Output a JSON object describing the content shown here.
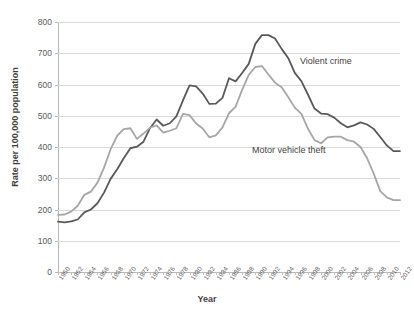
{
  "chart_data": {
    "type": "line",
    "title": "",
    "xlabel": "Year",
    "ylabel": "Rate per 100,000 population",
    "xlim": [
      1960,
      2012
    ],
    "ylim": [
      0,
      800
    ],
    "grid": true,
    "legend": "inline-annotations",
    "y_ticks": [
      0,
      100,
      200,
      300,
      400,
      500,
      600,
      700,
      800
    ],
    "x_tick_labels": [
      "1960",
      "1962",
      "1964",
      "1966",
      "1968",
      "1970",
      "1972",
      "1974",
      "1976",
      "1978",
      "1980",
      "1982",
      "1984",
      "1986",
      "1988",
      "1990",
      "1992",
      "1994",
      "1996",
      "1998",
      "2000",
      "2002",
      "2004",
      "2006",
      "2008",
      "2010",
      "2012"
    ],
    "x": [
      1960,
      1961,
      1962,
      1963,
      1964,
      1965,
      1966,
      1967,
      1968,
      1969,
      1970,
      1971,
      1972,
      1973,
      1974,
      1975,
      1976,
      1977,
      1978,
      1979,
      1980,
      1981,
      1982,
      1983,
      1984,
      1985,
      1986,
      1987,
      1988,
      1989,
      1990,
      1991,
      1992,
      1993,
      1994,
      1995,
      1996,
      1997,
      1998,
      1999,
      2000,
      2001,
      2002,
      2003,
      2004,
      2005,
      2006,
      2007,
      2008,
      2009,
      2010,
      2011,
      2012
    ],
    "series": [
      {
        "name": "Violent crime",
        "color": "#595959",
        "values": [
          161,
          159,
          162,
          168,
          191,
          200,
          220,
          254,
          298,
          329,
          364,
          396,
          401,
          417,
          461,
          488,
          468,
          476,
          498,
          549,
          597,
          594,
          571,
          538,
          539,
          557,
          620,
          610,
          637,
          666,
          730,
          758,
          758,
          747,
          714,
          685,
          637,
          611,
          568,
          523,
          507,
          505,
          494,
          476,
          463,
          469,
          479,
          472,
          458,
          432,
          405,
          387,
          387
        ]
      },
      {
        "name": "Motor vehicle theft",
        "color": "#a6a6a6",
        "values": [
          183,
          184,
          193,
          212,
          247,
          257,
          286,
          334,
          393,
          436,
          457,
          460,
          426,
          443,
          462,
          469,
          446,
          452,
          460,
          506,
          502,
          475,
          459,
          431,
          437,
          463,
          508,
          529,
          583,
          631,
          656,
          659,
          632,
          606,
          591,
          560,
          526,
          506,
          459,
          422,
          412,
          431,
          433,
          433,
          422,
          417,
          400,
          364,
          315,
          259,
          239,
          230,
          230
        ]
      }
    ]
  },
  "axes": {
    "y_title": "Rate per 100,000 population",
    "x_title": "Year"
  },
  "annotations": {
    "violent_crime_label": "Violent crime",
    "motor_vehicle_theft_label": "Motor vehicle theft"
  }
}
